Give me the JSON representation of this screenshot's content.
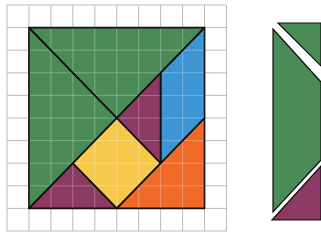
{
  "figure": {
    "type": "tangram-grid-puzzle",
    "grid": {
      "cols": 10,
      "rows": 10,
      "line_color": "#b9b9b9"
    },
    "square": {
      "size_units": 8
    },
    "colors": {
      "green": "#4b8b57",
      "purple": "#8b3a62",
      "blue": "#3d96d3",
      "yellow": "#f7c94a",
      "orange": "#f06a2a",
      "outline": "#111111",
      "inner_grid": "#9fbfa6"
    },
    "pieces": [
      {
        "name": "large-triangle-top",
        "color": "green",
        "points_units": [
          [
            0,
            0
          ],
          [
            8,
            0
          ],
          [
            4,
            4
          ]
        ]
      },
      {
        "name": "large-triangle-left",
        "color": "green",
        "points_units": [
          [
            0,
            0
          ],
          [
            4,
            4
          ],
          [
            0,
            8
          ]
        ]
      },
      {
        "name": "small-triangle-upper",
        "color": "purple",
        "points_units": [
          [
            4,
            4
          ],
          [
            6,
            2
          ],
          [
            6,
            6
          ]
        ]
      },
      {
        "name": "parallelogram",
        "color": "blue",
        "points_units": [
          [
            6,
            2
          ],
          [
            8,
            0
          ],
          [
            8,
            4
          ],
          [
            6,
            6
          ]
        ]
      },
      {
        "name": "square",
        "color": "yellow",
        "points_units": [
          [
            4,
            4
          ],
          [
            6,
            6
          ],
          [
            4,
            8
          ],
          [
            2,
            6
          ]
        ]
      },
      {
        "name": "medium-triangle",
        "color": "orange",
        "points_units": [
          [
            4,
            8
          ],
          [
            8,
            4
          ],
          [
            8,
            8
          ]
        ]
      },
      {
        "name": "small-triangle-lower",
        "color": "purple",
        "points_units": [
          [
            0,
            8
          ],
          [
            2,
            6
          ],
          [
            4,
            8
          ]
        ]
      }
    ],
    "partial_figure_right": {
      "visible_pieces": [
        "green-triangle-top",
        "green-triangle-left",
        "purple-triangle-bottom"
      ]
    }
  }
}
